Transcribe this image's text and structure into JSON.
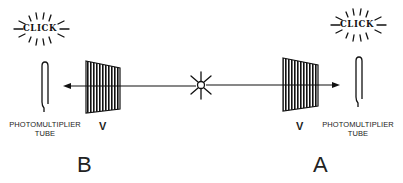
{
  "diagram": {
    "source": {
      "icon": "light-source-star-icon"
    },
    "stations": [
      {
        "id": "B",
        "label": "B",
        "click_text": "CLICK",
        "detector_label_line1": "PHOTOMULTIPLIER",
        "detector_label_line2": "TUBE",
        "polarizer_label": "V",
        "side": "left"
      },
      {
        "id": "A",
        "label": "A",
        "click_text": "CLICK",
        "detector_label_line1": "PHOTOMULTIPLIER",
        "detector_label_line2": "TUBE",
        "polarizer_label": "V",
        "side": "right"
      }
    ],
    "colors": {
      "ink": "#111111",
      "background": "#ffffff"
    }
  }
}
